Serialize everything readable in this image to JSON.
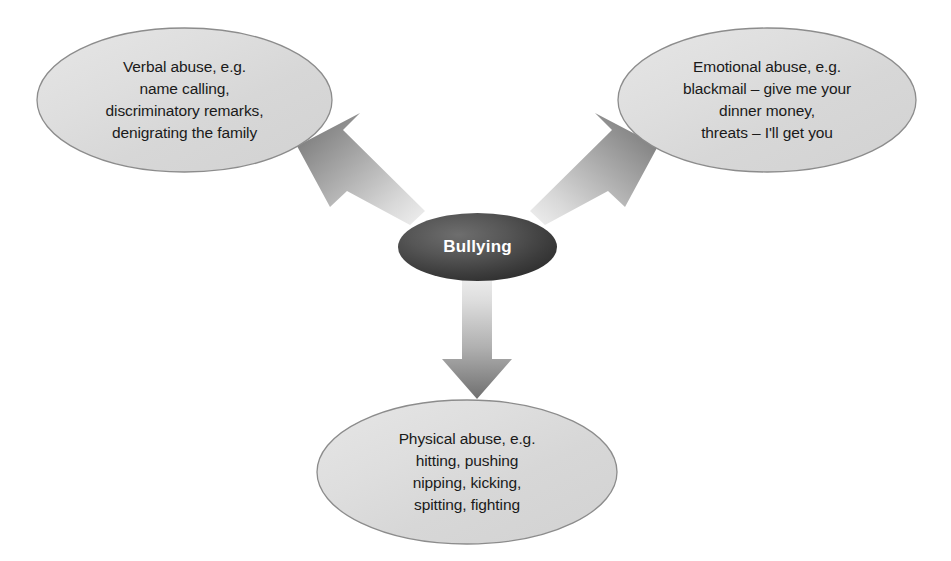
{
  "diagram": {
    "center": {
      "id": "bullying",
      "label": "Bullying",
      "shape": "ellipse",
      "fill": "#4a4a4a",
      "text_color": "#ffffff"
    },
    "nodes": [
      {
        "id": "verbal-abuse",
        "position": "top-left",
        "shape": "ellipse",
        "fill": "#dcdcdc",
        "stroke": "#8c8c8c",
        "text_color": "#1a1a1a",
        "lines": [
          "Verbal abuse, e.g.",
          "name calling,",
          "discriminatory remarks,",
          "denigrating the family"
        ]
      },
      {
        "id": "emotional-abuse",
        "position": "top-right",
        "shape": "ellipse",
        "fill": "#dcdcdc",
        "stroke": "#8c8c8c",
        "text_color": "#1a1a1a",
        "lines": [
          "Emotional abuse, e.g.",
          "blackmail – give me your",
          "dinner money,",
          "threats – I'll get you"
        ]
      },
      {
        "id": "physical-abuse",
        "position": "bottom-center",
        "shape": "ellipse",
        "fill": "#dcdcdc",
        "stroke": "#8c8c8c",
        "text_color": "#1a1a1a",
        "lines": [
          "Physical abuse, e.g.",
          "hitting, pushing",
          "nipping, kicking,",
          "spitting, fighting"
        ]
      }
    ],
    "connectors": [
      {
        "id": "arrow-to-verbal-abuse",
        "from": "bullying",
        "to": "verbal-abuse",
        "direction": "up-left",
        "style": "block-arrow-gradient"
      },
      {
        "id": "arrow-to-emotional-abuse",
        "from": "bullying",
        "to": "emotional-abuse",
        "direction": "up-right",
        "style": "block-arrow-gradient"
      },
      {
        "id": "arrow-to-physical-abuse",
        "from": "bullying",
        "to": "physical-abuse",
        "direction": "down",
        "style": "block-arrow-gradient"
      }
    ]
  }
}
